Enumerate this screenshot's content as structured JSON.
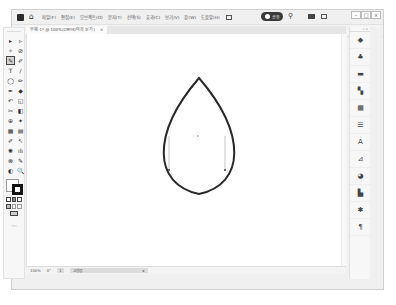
{
  "titlebar": {
    "menu": [
      "파일(F)",
      "편집(E)",
      "오브젝트(O)",
      "문자(T)",
      "선택(S)",
      "효과(C)",
      "보기(V)",
      "창(W)",
      "도움말(H)"
    ],
    "user_label": "공유",
    "window_controls": [
      "–",
      "□",
      "×"
    ]
  },
  "control_bar": {
    "left_label": "패스",
    "items": [
      "획:",
      "↖",
      "↗",
      "변환",
      "✓",
      "고정점",
      "✦",
      "⊏",
      "⌂",
      "⊐",
      "≡",
      "≡",
      "≡",
      "╤",
      "╨",
      "╩",
      "모양",
      "✕",
      "✐"
    ],
    "right_items": [
      "⋮⋮",
      "|≡",
      "≡"
    ]
  },
  "document_tab": {
    "title": "무제-1* @ 100%(CMYK/미리 보기)",
    "close": "×"
  },
  "toolbox": {
    "tools": [
      "▸",
      "▹",
      "✧",
      "⊘",
      "✎",
      "✐",
      "T",
      "/",
      "◯",
      "✏",
      "✒",
      "◆",
      "↶",
      "◱",
      "✂",
      "◧",
      "⊕",
      "✦",
      "▦",
      "▤",
      "✐",
      "↖",
      "✺",
      "ılı",
      "⊗",
      "✎",
      "◐",
      "🔍"
    ],
    "selected_index": 4,
    "more": "···"
  },
  "right_panel": {
    "icons": [
      "◆",
      "♣",
      "▬",
      "▚",
      "▦",
      "☰",
      "A",
      "⊿",
      "◕",
      "▙",
      "✱",
      "¶"
    ]
  },
  "statusbar": {
    "zoom": "100%",
    "angle": "0°",
    "artboard": "1",
    "tool_name": "고정점",
    "arrow": "▸"
  },
  "canvas": {
    "shape": "lens/leaf path",
    "stroke_color": "#2a2a2a"
  }
}
